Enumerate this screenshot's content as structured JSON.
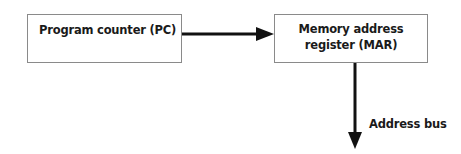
{
  "diagram": {
    "nodes": [
      {
        "id": "pc",
        "label": "Program counter (PC)"
      },
      {
        "id": "mar",
        "label_line1": "Memory address",
        "label_line2": "register (MAR)"
      }
    ],
    "edges": [
      {
        "from": "pc",
        "to": "mar",
        "label": ""
      },
      {
        "from": "mar",
        "to": "address-bus",
        "label": "Address bus"
      }
    ],
    "colors": {
      "line": "#111111",
      "border": "#8a8a8a",
      "text": "#1a1a1a"
    }
  }
}
